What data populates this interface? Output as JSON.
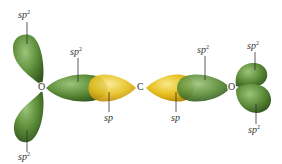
{
  "diagram": {
    "atoms": {
      "left_oxygen": "O",
      "carbon": "C",
      "right_oxygen": "O"
    },
    "labels": {
      "left_o_top": {
        "base": "sp",
        "sup": "2"
      },
      "left_o_bottom": {
        "base": "sp",
        "sup": "2"
      },
      "left_o_bond": {
        "base": "sp",
        "sup": "2"
      },
      "left_c_bond": {
        "base": "sp",
        "sup": ""
      },
      "right_c_bond": {
        "base": "sp",
        "sup": ""
      },
      "right_o_bond": {
        "base": "sp",
        "sup": "2"
      },
      "right_o_top": {
        "base": "sp",
        "sup": "2"
      },
      "right_o_bottom": {
        "base": "sp",
        "sup": "2"
      }
    },
    "colors": {
      "sp2_orbital": "#5e8f3a",
      "sp2_orbital_dark": "#3f6a26",
      "sp2_orbital_light": "#8db86a",
      "sp_orbital": "#e8c020",
      "sp_orbital_dark": "#c99a10",
      "sp_orbital_light": "#f5e070",
      "leader_line": "#333333",
      "text": "#333333"
    }
  }
}
